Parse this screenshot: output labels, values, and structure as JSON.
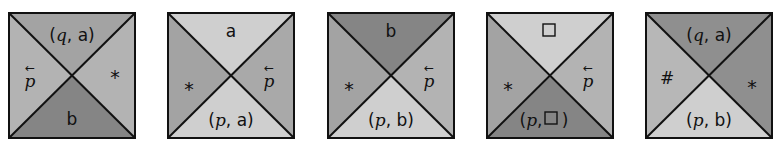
{
  "colors": {
    "light": "#cfcfcf",
    "medium": "#a9a9a9",
    "dark": "#828282",
    "border": "#111111"
  },
  "tiles": [
    {
      "top": {
        "label": "(q, a)",
        "shade": "medium"
      },
      "right": {
        "label": "*",
        "shade": "medium"
      },
      "bottom": {
        "label": "b",
        "shade": "dark"
      },
      "left": {
        "label": "p⃖",
        "shade": "medium"
      }
    },
    {
      "top": {
        "label": "a",
        "shade": "light"
      },
      "right": {
        "label": "p⃖",
        "shade": "medium"
      },
      "bottom": {
        "label": "(p, a)",
        "shade": "light"
      },
      "left": {
        "label": "*",
        "shade": "medium"
      }
    },
    {
      "top": {
        "label": "b",
        "shade": "dark"
      },
      "right": {
        "label": "p⃖",
        "shade": "medium"
      },
      "bottom": {
        "label": "(p, b)",
        "shade": "light"
      },
      "left": {
        "label": "*",
        "shade": "medium"
      }
    },
    {
      "top": {
        "label": "□",
        "shade": "light"
      },
      "right": {
        "label": "p⃖",
        "shade": "medium"
      },
      "bottom": {
        "label": "(p, □)",
        "shade": "dark"
      },
      "left": {
        "label": "*",
        "shade": "medium"
      }
    },
    {
      "top": {
        "label": "(q, a)",
        "shade": "medium"
      },
      "right": {
        "label": "*",
        "shade": "medium"
      },
      "bottom": {
        "label": "(p, b)",
        "shade": "light"
      },
      "left": {
        "label": "#",
        "shade": "light"
      }
    }
  ]
}
